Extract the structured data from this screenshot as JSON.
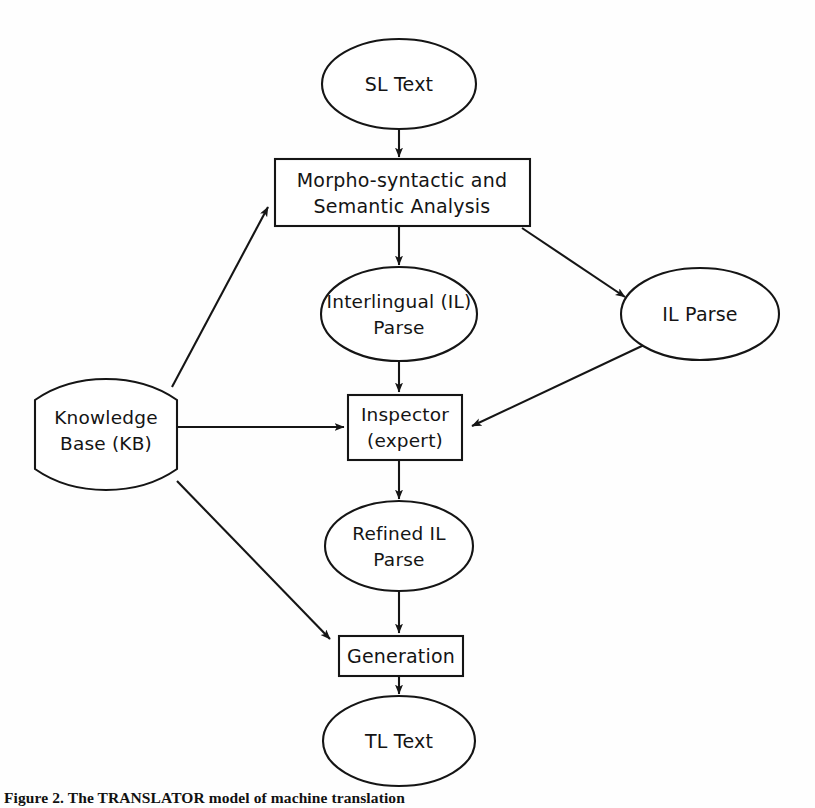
{
  "figure": {
    "caption": "Figure 2. The TRANSLATOR model of machine translation",
    "background_color": "#fefefe",
    "line_color": "#151515"
  },
  "diagram": {
    "type": "flowchart",
    "title": "TRANSLATOR model of machine translation",
    "nodes": [
      {
        "id": "sl-text",
        "label": "SL Text",
        "shape": "ellipse",
        "cx": 399,
        "cy": 84,
        "rx": 77,
        "ry": 45
      },
      {
        "id": "morpho-syntactic-analysis",
        "label_line1": "Morpho-syntactic  and",
        "label_line2": "Semantic Analysis",
        "shape": "rectangle",
        "x": 275,
        "y": 159,
        "w": 255,
        "h": 67
      },
      {
        "id": "interlingual-parse",
        "label_line1": "Interlingual (IL)",
        "label_line2": "Parse",
        "shape": "ellipse",
        "cx": 399,
        "cy": 314,
        "rx": 78,
        "ry": 47
      },
      {
        "id": "il-parse",
        "label": "IL Parse",
        "shape": "ellipse",
        "cx": 700,
        "cy": 314,
        "rx": 79,
        "ry": 46
      },
      {
        "id": "knowledge-base",
        "label_line1": "Knowledge",
        "label_line2": "Base (KB)",
        "shape": "curved-tape",
        "x": 35,
        "y": 382,
        "w": 142,
        "h": 105
      },
      {
        "id": "inspector",
        "label_line1": "Inspector",
        "label_line2": "(expert)",
        "shape": "rectangle",
        "x": 348,
        "y": 395,
        "w": 114,
        "h": 65
      },
      {
        "id": "refined-il-parse",
        "label_line1": "Refined IL",
        "label_line2": "Parse",
        "shape": "ellipse",
        "cx": 399,
        "cy": 546,
        "rx": 74,
        "ry": 45
      },
      {
        "id": "generation",
        "label": "Generation",
        "shape": "rectangle",
        "x": 339,
        "y": 636,
        "w": 124,
        "h": 40
      },
      {
        "id": "tl-text",
        "label": "TL Text",
        "shape": "ellipse",
        "cx": 399,
        "cy": 741,
        "rx": 76,
        "ry": 45
      }
    ],
    "edges": [
      {
        "id": "sl-to-morpho",
        "from": "sl-text",
        "to": "morpho-syntactic-analysis",
        "style": "vertical-arrow"
      },
      {
        "id": "morpho-to-interlingual",
        "from": "morpho-syntactic-analysis",
        "to": "interlingual-parse",
        "style": "vertical-arrow"
      },
      {
        "id": "morpho-to-il-parse",
        "from": "morpho-syntactic-analysis",
        "to": "il-parse",
        "style": "diagonal-arrow"
      },
      {
        "id": "interlingual-to-inspector",
        "from": "interlingual-parse",
        "to": "inspector",
        "style": "vertical-arrow"
      },
      {
        "id": "il-parse-to-inspector",
        "from": "il-parse",
        "to": "inspector",
        "style": "diagonal-arrow"
      },
      {
        "id": "kb-to-morpho",
        "from": "knowledge-base",
        "to": "morpho-syntactic-analysis",
        "style": "diagonal-arrow"
      },
      {
        "id": "kb-to-inspector",
        "from": "knowledge-base",
        "to": "inspector",
        "style": "horizontal-arrow"
      },
      {
        "id": "kb-to-generation",
        "from": "knowledge-base",
        "to": "generation",
        "style": "diagonal-arrow"
      },
      {
        "id": "inspector-to-refined",
        "from": "inspector",
        "to": "refined-il-parse",
        "style": "vertical-arrow"
      },
      {
        "id": "refined-to-generation",
        "from": "refined-il-parse",
        "to": "generation",
        "style": "vertical-arrow"
      },
      {
        "id": "generation-to-tl",
        "from": "generation",
        "to": "tl-text",
        "style": "vertical-arrow"
      }
    ]
  }
}
